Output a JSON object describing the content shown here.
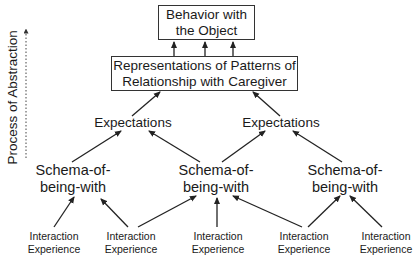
{
  "diagram": {
    "top_box": {
      "line1": "Behavior with",
      "line2": "the Object"
    },
    "middle_box": {
      "line1": "Representations of Patterns of",
      "line2": "Relationship with Caregiver"
    },
    "expectations": [
      "Expectations",
      "Expectations"
    ],
    "schemas": [
      {
        "line1": "Schema-of-",
        "line2": "being-with"
      },
      {
        "line1": "Schema-of-",
        "line2": "being-with"
      },
      {
        "line1": "Schema-of-",
        "line2": "being-with"
      }
    ],
    "interactions": [
      {
        "line1": "Interaction",
        "line2": "Experience"
      },
      {
        "line1": "Interaction",
        "line2": "Experience"
      },
      {
        "line1": "Interaction",
        "line2": "Experience"
      },
      {
        "line1": "Interaction",
        "line2": "Experience"
      },
      {
        "line1": "Interaction",
        "line2": "Experience"
      }
    ],
    "axis_label": "Process of Abstraction",
    "colors": {
      "line": "#333333",
      "text": "#1a1a1a",
      "background": "#ffffff"
    }
  }
}
